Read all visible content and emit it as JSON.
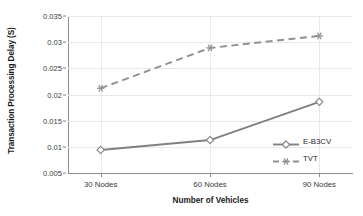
{
  "chart_data": {
    "type": "line",
    "title": "",
    "xlabel": "Number of Vehicles",
    "ylabel": "Transaction Processing Delay (S)",
    "categories": [
      "30 Nodes",
      "60 Nodes",
      "90 Nodes"
    ],
    "series": [
      {
        "name": "E-B3CV",
        "values": [
          0.0094,
          0.0113,
          0.0186
        ],
        "line_style": "solid",
        "marker": "diamond",
        "color": "#808080"
      },
      {
        "name": "TVT",
        "values": [
          0.0212,
          0.0289,
          0.0312
        ],
        "line_style": "dashed",
        "marker": "asterisk",
        "color": "#909090"
      }
    ],
    "ylim": [
      0.005,
      0.035
    ],
    "ytick_labels": [
      "0.035",
      "0.03",
      "0.025",
      "0.02",
      "0.015",
      "0.01",
      "0.005"
    ],
    "ytick_values": [
      0.035,
      0.03,
      0.025,
      0.02,
      0.015,
      0.01,
      0.005
    ],
    "grid": true,
    "legend_position": "inside-right"
  },
  "legend": {
    "entries": [
      {
        "label": "E-B3CV"
      },
      {
        "label": "TVT"
      }
    ]
  },
  "colors": {
    "series_primary": "#808080",
    "series_secondary": "#909090",
    "gridline": "#e8e8e8",
    "axis": "#8c8c8c",
    "text": "#1a1a1a",
    "background": "#ffffff"
  }
}
